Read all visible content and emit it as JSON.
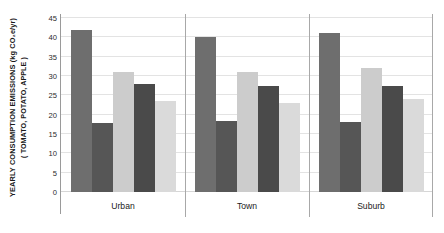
{
  "chart_data": {
    "type": "bar",
    "title": "",
    "subtitle": "",
    "xlabel": "",
    "ylabel": "YEARLY CONSUMPTION EMISSIONS (kg CO₂e/yr)",
    "ylabel_line2": "( TOMATO, POTATO, APPLE )",
    "categories": [
      "Urban",
      "Town",
      "Suburb"
    ],
    "series": [
      {
        "name": "series-1",
        "color": "#6e6e6e",
        "values": [
          42,
          40,
          41
        ]
      },
      {
        "name": "series-2",
        "color": "#565656",
        "values": [
          17.8,
          18.3,
          18
        ]
      },
      {
        "name": "series-3",
        "color": "#cccccc",
        "values": [
          31,
          31,
          32
        ]
      },
      {
        "name": "series-4",
        "color": "#4a4a4a",
        "values": [
          28,
          27.5,
          27.5
        ]
      },
      {
        "name": "series-5",
        "color": "#dadada",
        "values": [
          23.5,
          23,
          24
        ]
      }
    ],
    "ylim": [
      0,
      45
    ],
    "yticks": [
      0,
      5,
      10,
      15,
      20,
      25,
      30,
      35,
      40,
      45
    ],
    "ytick_labels": [
      "0",
      "5",
      "10",
      "15",
      "20",
      "25",
      "30",
      "35",
      "40",
      "45"
    ],
    "grid": true,
    "grid_axis": "y",
    "legend": false,
    "legend_position": "none",
    "group_separators": true,
    "background_color": "#ffffff",
    "gridline_color": "#e3e3e3",
    "axis_color": "#9a9a9a"
  }
}
